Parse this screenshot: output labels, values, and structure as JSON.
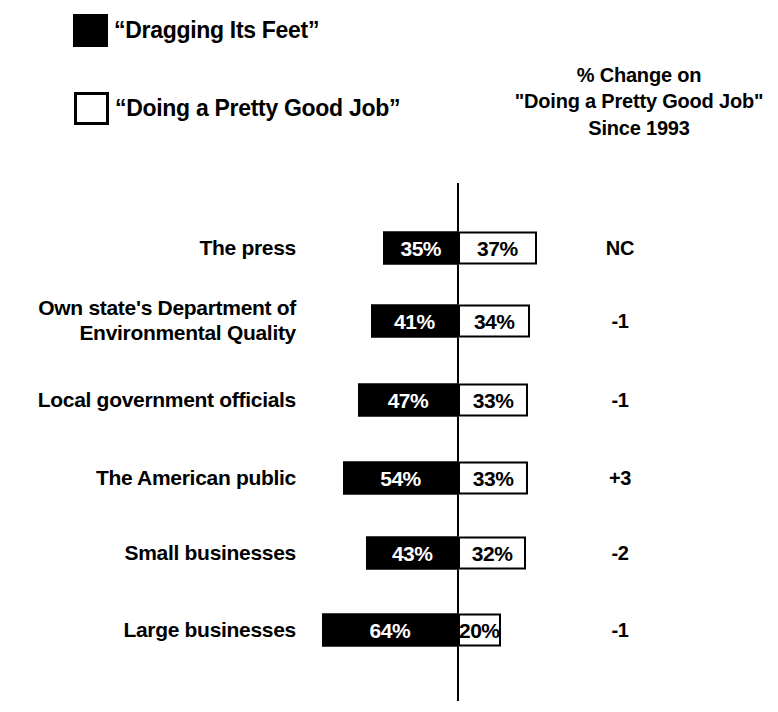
{
  "legend": {
    "items": [
      {
        "label": "“Dragging Its Feet”",
        "swatch": "filled-square-icon",
        "color": "#000000"
      },
      {
        "label": "“Doing a Pretty Good Job”",
        "swatch": "hollow-square-icon",
        "color": "#ffffff"
      }
    ]
  },
  "change_header": {
    "line1": "% Change on",
    "line2": "\"Doing a Pretty Good Job\"",
    "line3": "Since 1993"
  },
  "chart_data": {
    "type": "bar",
    "title": "",
    "subtype": "diverging-stacked-bar",
    "categories": [
      "The press",
      "Own state's Department of\nEnvironmental Quality",
      "Local government officials",
      "The American public",
      "Small businesses",
      "Large businesses"
    ],
    "series": [
      {
        "name": "“Dragging Its Feet”",
        "direction": "left",
        "color": "#000000",
        "values": [
          35,
          41,
          47,
          54,
          43,
          64
        ]
      },
      {
        "name": "“Doing a Pretty Good Job”",
        "direction": "right",
        "color": "#ffffff",
        "values": [
          37,
          34,
          33,
          33,
          32,
          20
        ]
      }
    ],
    "value_labels": {
      "dragging": [
        "35%",
        "41%",
        "47%",
        "54%",
        "43%",
        "64%"
      ],
      "good_job": [
        "37%",
        "34%",
        "33%",
        "33%",
        "32%",
        "20%"
      ]
    },
    "change_since_1993": [
      "NC",
      "-1",
      "-1",
      "+3",
      "-2",
      "-1"
    ],
    "xlabel": "",
    "ylabel": "",
    "grid": false,
    "legend_position": "top-left",
    "axis": {
      "type": "vertical-baseline",
      "position_pct": 0
    }
  },
  "rows": [
    {
      "label": "The press",
      "neg": 35,
      "pos": 37,
      "neg_label": "35%",
      "pos_label": "37%",
      "change": "NC",
      "y": 248
    },
    {
      "label": "Own state's Department of\nEnvironmental Quality",
      "neg": 41,
      "pos": 34,
      "neg_label": "41%",
      "pos_label": "34%",
      "change": "-1",
      "y": 321
    },
    {
      "label": "Local government officials",
      "neg": 47,
      "pos": 33,
      "neg_label": "47%",
      "pos_label": "33%",
      "change": "-1",
      "y": 400
    },
    {
      "label": "The American public",
      "neg": 54,
      "pos": 33,
      "neg_label": "54%",
      "pos_label": "33%",
      "change": "+3",
      "y": 478
    },
    {
      "label": "Small businesses",
      "neg": 43,
      "pos": 32,
      "neg_label": "43%",
      "pos_label": "32%",
      "change": "-2",
      "y": 553
    },
    {
      "label": "Large businesses",
      "neg": 64,
      "pos": 20,
      "neg_label": "64%",
      "pos_label": "20%",
      "change": "-1",
      "y": 630
    }
  ],
  "scale_px_per_point": 2.13
}
